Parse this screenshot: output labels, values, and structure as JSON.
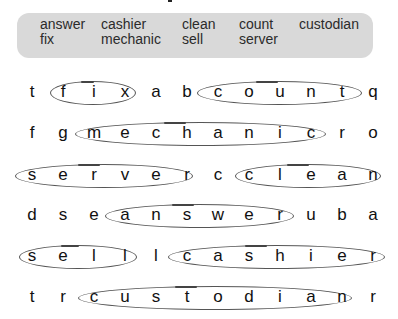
{
  "word_bank": {
    "words": [
      {
        "text": "answer",
        "x": 40,
        "y": 24
      },
      {
        "text": "cashier",
        "x": 101,
        "y": 24
      },
      {
        "text": "clean",
        "x": 182,
        "y": 24
      },
      {
        "text": "count",
        "x": 239,
        "y": 24
      },
      {
        "text": "custodian",
        "x": 299,
        "y": 24
      },
      {
        "text": "fix",
        "x": 40,
        "y": 39
      },
      {
        "text": "mechanic",
        "x": 101,
        "y": 39
      },
      {
        "text": "sell",
        "x": 182,
        "y": 39
      },
      {
        "text": "server",
        "x": 239,
        "y": 39
      }
    ]
  },
  "grid": {
    "columns_x": [
      32,
      63,
      94,
      125,
      156,
      187,
      218,
      249,
      280,
      311,
      342,
      373
    ],
    "rows": [
      {
        "y": 93,
        "letters": [
          "t",
          "f",
          "i",
          "x",
          "a",
          "b",
          "c",
          "o",
          "u",
          "n",
          "t",
          "q"
        ]
      },
      {
        "y": 134,
        "letters": [
          "f",
          "g",
          "m",
          "e",
          "c",
          "h",
          "a",
          "n",
          "i",
          "c",
          "r",
          "o"
        ]
      },
      {
        "y": 176,
        "letters": [
          "s",
          "e",
          "r",
          "v",
          "e",
          "r",
          "c",
          "c",
          "l",
          "e",
          "a",
          "n"
        ]
      },
      {
        "y": 216,
        "letters": [
          "d",
          "s",
          "e",
          "a",
          "n",
          "s",
          "w",
          "e",
          "r",
          "u",
          "b",
          "a"
        ]
      },
      {
        "y": 257,
        "letters": [
          "s",
          "e",
          "l",
          "l",
          "l",
          "c",
          "a",
          "s",
          "h",
          "i",
          "e",
          "r"
        ]
      },
      {
        "y": 298,
        "letters": [
          "t",
          "r",
          "c",
          "u",
          "s",
          "t",
          "o",
          "d",
          "i",
          "a",
          "n",
          "r"
        ]
      }
    ]
  },
  "found_words": [
    {
      "word": "fix",
      "row": 0,
      "x1": 50,
      "x2": 136
    },
    {
      "word": "count",
      "row": 0,
      "x1": 197,
      "x2": 362
    },
    {
      "word": "mechanic",
      "row": 1,
      "x1": 75,
      "x2": 326
    },
    {
      "word": "server",
      "row": 2,
      "x1": 15,
      "x2": 193
    },
    {
      "word": "clean",
      "row": 2,
      "x1": 235,
      "x2": 381
    },
    {
      "word": "answer",
      "row": 3,
      "x1": 105,
      "x2": 294
    },
    {
      "word": "sell",
      "row": 4,
      "x1": 19,
      "x2": 137
    },
    {
      "word": "cashier",
      "row": 4,
      "x1": 168,
      "x2": 385
    },
    {
      "word": "custodian",
      "row": 5,
      "x1": 78,
      "x2": 352
    }
  ],
  "colors": {
    "word_bank_bg": "#d9d9d9",
    "ring_stroke": "#555555",
    "letter": "#111111"
  }
}
